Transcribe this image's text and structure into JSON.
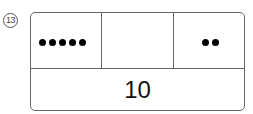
{
  "problem": {
    "number_label": "13",
    "cells": [
      {
        "dots": 5
      },
      {
        "dots": 0
      },
      {
        "dots": 2
      }
    ],
    "total": "10"
  }
}
